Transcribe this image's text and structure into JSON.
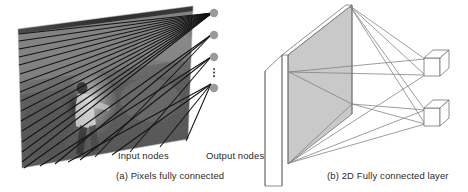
{
  "figure": {
    "background": "#ffffff"
  },
  "panel_a": {
    "id": "a",
    "caption": "(a) Pixels fully connected",
    "input_label": "Input nodes",
    "output_label": "Output nodes",
    "image": {
      "name": "grayscale-photo-person-walking",
      "description": "Grayscale photograph of a person, rendered on a tilted 3D plane",
      "tone_dark": "#3d3d3d",
      "tone_mid": "#6f6f6f",
      "tone_light": "#c9c9c9"
    },
    "connection_lines": {
      "count": 22,
      "color": "#1a1a1a"
    },
    "output_nodes": {
      "color": "#9a9a9a",
      "count": 4,
      "ellipsis": "⋮",
      "ellipsis_between": [
        3,
        4
      ]
    }
  },
  "panel_b": {
    "id": "b",
    "caption": "(b) 2D Fully connected layer",
    "plane": {
      "name": "input-plane",
      "fill": "#c9c9c9",
      "stroke": "#6a6a6a"
    },
    "output_boxes": {
      "count": 2,
      "fill": "#ffffff",
      "stroke": "#6a6a6a"
    },
    "connection_lines": {
      "count": 8,
      "color": "#7d7d7d"
    }
  },
  "colors": {
    "text": "#2b2b2b",
    "node_gray": "#9a9a9a",
    "line_dark": "#1a1a1a",
    "line_light": "#7d7d7d",
    "plane_fill": "#c9c9c9"
  }
}
